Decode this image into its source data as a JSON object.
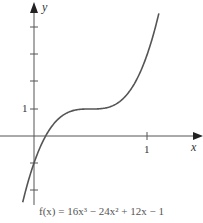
{
  "chart_data": {
    "type": "line",
    "title": "",
    "function": "f(x) = 16x^3 - 24x^2 + 12x - 1",
    "caption": "f(x) = 16x³ − 24x² + 12x − 1",
    "xlabel": "x",
    "ylabel": "y",
    "x_ticks": [
      1
    ],
    "y_ticks": [
      -2,
      -1,
      1,
      2,
      3,
      4
    ],
    "x_tick_labels": [
      "1"
    ],
    "y_tick_labels": [
      "1"
    ],
    "xlim": [
      -0.3,
      1.5
    ],
    "ylim": [
      -2.5,
      5
    ],
    "grid": false,
    "series": [
      {
        "name": "f(x)",
        "x": [
          -0.1,
          0,
          0.1,
          0.2,
          0.3,
          0.4,
          0.5,
          0.6,
          0.7,
          0.8,
          0.9,
          1.0,
          1.1
        ],
        "values": [
          -2.456,
          -1,
          -0.024,
          0.528,
          0.792,
          0.904,
          1.0,
          1.096,
          1.208,
          1.472,
          2.024,
          3.0,
          4.456
        ]
      }
    ]
  },
  "labels": {
    "x_axis": "x",
    "y_axis": "y",
    "x_one": "1",
    "y_one": "1"
  }
}
